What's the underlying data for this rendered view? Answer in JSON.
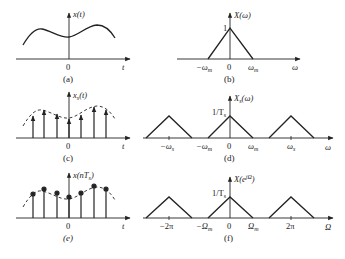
{
  "figure": {
    "panels": [
      {
        "id": "a",
        "caption": "(a)",
        "ylabel": "x(t)",
        "xlabel": "t",
        "origin": "0",
        "type": "continuous-time signal"
      },
      {
        "id": "b",
        "caption": "(b)",
        "ylabel": "X(ω)",
        "xlabel": "ω",
        "origin": "0",
        "peak_label": "1",
        "ticks": [
          "−ωm",
          "ωm"
        ],
        "type": "band-limited spectrum"
      },
      {
        "id": "c",
        "caption": "(c)",
        "ylabel": "xs(t)",
        "xlabel": "t",
        "origin": "0",
        "type": "impulse-sampled signal"
      },
      {
        "id": "d",
        "caption": "(d)",
        "ylabel": "Xs(ω)",
        "xlabel": "ω",
        "origin": "0",
        "peak_label": "1/Ts",
        "ticks": [
          "−ωs",
          "−ωm",
          "ωm",
          "ωs"
        ],
        "type": "periodic spectrum"
      },
      {
        "id": "e",
        "caption": "(e)",
        "ylabel": "x(nTs)",
        "xlabel": "t",
        "origin": "0",
        "type": "discrete-time sequence"
      },
      {
        "id": "f",
        "caption": "(f)",
        "ylabel": "X(e^jΩ)",
        "xlabel": "Ω",
        "origin": "0",
        "peak_label": "1/Ts",
        "ticks": [
          "−2π",
          "−Ωm",
          "Ωm",
          "2π"
        ],
        "type": "DTFT spectrum"
      }
    ]
  },
  "labels": {
    "a_y": "x(t)",
    "a_x": "t",
    "a_0": "0",
    "a_cap": "(a)",
    "b_y": "X(ω)",
    "b_x": "ω",
    "b_0": "0",
    "b_1": "1",
    "b_neg": "−ω",
    "b_neg_sub": "m",
    "b_pos": "ω",
    "b_pos_sub": "m",
    "b_cap": "(b)",
    "c_y": "x",
    "c_y_sub": "s",
    "c_y_arg": "(t)",
    "c_x": "t",
    "c_0": "0",
    "c_cap": "(c)",
    "d_y": "X",
    "d_y_sub": "s",
    "d_y_arg": "(ω)",
    "d_x": "ω",
    "d_0": "0",
    "d_peak": "1/T",
    "d_peak_sub": "s",
    "d_t1": "−ω",
    "d_t1_sub": "s",
    "d_t2": "−ω",
    "d_t2_sub": "m",
    "d_t3": "ω",
    "d_t3_sub": "m",
    "d_t4": "ω",
    "d_t4_sub": "s",
    "d_cap": "(d)",
    "e_y": "x(nT",
    "e_y_sub": "s",
    "e_y_end": ")",
    "e_x": "t",
    "e_0": "0",
    "e_cap": "(e)",
    "f_y": "X(e",
    "f_y_sup": "jΩ",
    "f_y_end": ")",
    "f_x": "Ω",
    "f_0": "0",
    "f_peak": "1/T",
    "f_peak_sub": "s",
    "f_t1": "−2π",
    "f_t2": "−Ω",
    "f_t2_sub": "m",
    "f_t3": "Ω",
    "f_t3_sub": "m",
    "f_t4": "2π",
    "f_cap": "(f)"
  },
  "colors": {
    "stroke": "#222222",
    "background": "#ffffff"
  }
}
